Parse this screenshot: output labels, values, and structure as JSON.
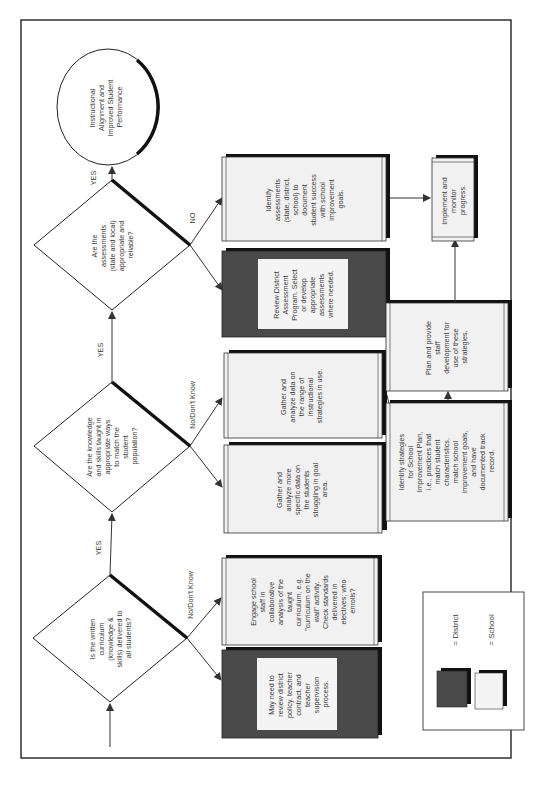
{
  "diagram": {
    "orientation": "rotated 90deg counter-clockwise",
    "goal": {
      "lines": [
        "Instructional",
        "Alignment and",
        "Improved Student",
        "Performance"
      ]
    },
    "decisions": [
      {
        "id": "q1",
        "lines": [
          "Is the written",
          "curriculum",
          "(knowledge &",
          "skills) delivered to",
          "all students?"
        ],
        "yes_label": "YES",
        "no_label": "No/Don't Know"
      },
      {
        "id": "q2",
        "lines": [
          "Are the knowledge",
          "and skills taught in",
          "appropriate ways",
          "to match the",
          "student",
          "population?"
        ],
        "yes_label": "YES",
        "no_label": "No/Don't Know"
      },
      {
        "id": "q3",
        "lines": [
          "Are the",
          "assessments",
          "(state and local)",
          "appropriate and",
          "reliable?"
        ],
        "yes_label": "YES",
        "no_label": "NO"
      }
    ],
    "boxes": {
      "may_need": {
        "type": "district",
        "lines": [
          "May need to",
          "review district",
          "policy, teacher",
          "contract, and",
          "teacher",
          "supervision",
          "process."
        ]
      },
      "engage": {
        "type": "school",
        "lines": [
          "Engage school",
          "staff in",
          "collaborative",
          "analysis of the",
          "taught",
          "curriculum, e.g.",
          "\"curriculum on the",
          "wall\" activity.",
          "Check standards",
          "delivered in",
          "electives; who",
          "enrolls?"
        ]
      },
      "gather_specific": {
        "type": "school",
        "lines": [
          "Gather and",
          "analyze more",
          "specific data on",
          "the students",
          "struggling in goal",
          "area."
        ]
      },
      "gather_range": {
        "type": "school",
        "lines": [
          "Gather and",
          "analyze data on",
          "the range of",
          "instructional",
          "strategies in use."
        ]
      },
      "review_district": {
        "type": "district",
        "lines": [
          "Review District",
          "Assessment",
          "Program. Select",
          "or develop",
          "appropriate",
          "assessments",
          "where needed."
        ]
      },
      "identify_assessments": {
        "type": "school",
        "lines": [
          "Identify",
          "assessments",
          "(state, district,",
          "school) to",
          "document",
          "student success",
          "with school",
          "improvement",
          "goals."
        ]
      },
      "identify_strategies": {
        "type": "school",
        "lines": [
          "Identify strategies",
          "for School",
          "Improvement Plan,",
          "i.e., practices that",
          "match student",
          "characteristics,",
          "match school",
          "improvement goals,",
          "and have",
          "documented track",
          "record."
        ]
      },
      "plan_provide": {
        "type": "school",
        "lines": [
          "Plan and provide",
          "staff",
          "development for",
          "use of these",
          "strategies."
        ]
      },
      "implement": {
        "type": "school",
        "lines": [
          "Implement and",
          "monitor",
          "progress."
        ]
      }
    },
    "legend": {
      "district_label": "= District",
      "school_label": "= School"
    },
    "colors": {
      "district_fill": "#4a4a4a",
      "school_fill": "#f2f2f2",
      "line": "#333333",
      "border": "#222222"
    }
  }
}
